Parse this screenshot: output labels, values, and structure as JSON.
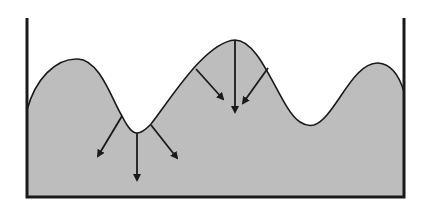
{
  "diagram": {
    "colors": {
      "fill": "#bdbdbd",
      "stroke": "#1a1a1a",
      "background": "#ffffff"
    },
    "container": {
      "left_wall_x": 27,
      "right_wall_x": 404,
      "top_y": 18,
      "bottom_y": 197
    },
    "surface_curve": {
      "path": "M27,110 C35,80 55,58 78,59 C100,60 112,100 122,116 C128,128 132,133 137,133 C143,133 147,128 151,124 C170,100 205,42 235,40 C262,40 280,110 300,122 C306,126 310,126 314,125 C335,118 352,62 378,63 C392,64 400,78 404,92"
    },
    "arrow_groups": [
      {
        "location": "valley",
        "arrows": [
          {
            "x1": 122,
            "y1": 116,
            "x2": 98,
            "y2": 156
          },
          {
            "x1": 137,
            "y1": 133,
            "x2": 137,
            "y2": 180
          },
          {
            "x1": 151,
            "y1": 125,
            "x2": 177,
            "y2": 158
          }
        ]
      },
      {
        "location": "peak",
        "arrows": [
          {
            "x1": 196,
            "y1": 69,
            "x2": 223,
            "y2": 99
          },
          {
            "x1": 235,
            "y1": 40,
            "x2": 235,
            "y2": 112
          },
          {
            "x1": 268,
            "y1": 68,
            "x2": 243,
            "y2": 103
          }
        ]
      }
    ]
  }
}
